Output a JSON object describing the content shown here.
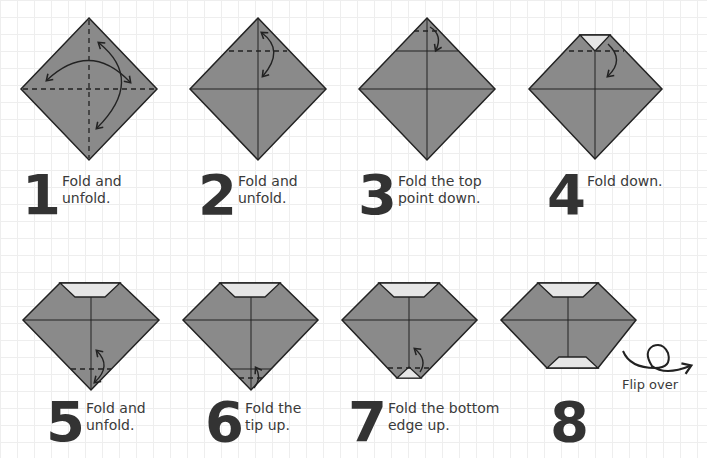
{
  "colors": {
    "paper_fill": "#8a8a8a",
    "paper_back": "#e6e6e6",
    "outline": "#222222",
    "grid": "#eeeeee",
    "text": "#333333"
  },
  "steps": [
    {
      "number": "1",
      "text_line1": "Fold and",
      "text_line2": "unfold."
    },
    {
      "number": "2",
      "text_line1": "Fold and",
      "text_line2": "unfold."
    },
    {
      "number": "3",
      "text_line1": "Fold the top",
      "text_line2": "point down."
    },
    {
      "number": "4",
      "text_line1": "Fold down.",
      "text_line2": ""
    },
    {
      "number": "5",
      "text_line1": "Fold and",
      "text_line2": "unfold."
    },
    {
      "number": "6",
      "text_line1": "Fold the",
      "text_line2": "tip up."
    },
    {
      "number": "7",
      "text_line1": "Fold the bottom",
      "text_line2": "edge up."
    },
    {
      "number": "8",
      "text_line1": "",
      "text_line2": ""
    }
  ],
  "flip": {
    "label": "Flip over",
    "icon": "flip-over-loop-arrow-icon"
  }
}
